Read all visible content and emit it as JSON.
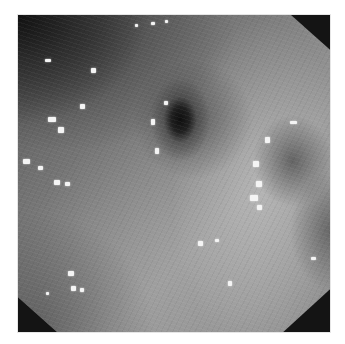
{
  "image": {
    "description": "Grayscale endoscopic view of mucosal tissue with a dark central lumen opening and a second fainter depression on the right, scattered specular light reflections, framed in an octagonal black mask on a white background",
    "colors": {
      "background": "#ffffff",
      "mask": "#141414",
      "tissue_mid": "#8c8c8c",
      "tissue_dark": "#555555",
      "lumen": "#0a0a0a",
      "highlight": "#f4f4f4"
    },
    "features": [
      {
        "name": "central-lumen",
        "x_pct": 52,
        "y_pct": 33
      },
      {
        "name": "right-depression",
        "x_pct": 88,
        "y_pct": 46
      }
    ],
    "highlights": [
      {
        "x": 27,
        "y": 44,
        "w": 6,
        "h": 3
      },
      {
        "x": 73,
        "y": 53,
        "w": 5,
        "h": 5
      },
      {
        "x": 30,
        "y": 102,
        "w": 8,
        "h": 5
      },
      {
        "x": 40,
        "y": 112,
        "w": 6,
        "h": 6
      },
      {
        "x": 62,
        "y": 89,
        "w": 5,
        "h": 5
      },
      {
        "x": 5,
        "y": 144,
        "w": 7,
        "h": 5
      },
      {
        "x": 20,
        "y": 151,
        "w": 5,
        "h": 4
      },
      {
        "x": 36,
        "y": 165,
        "w": 6,
        "h": 5
      },
      {
        "x": 47,
        "y": 167,
        "w": 5,
        "h": 4
      },
      {
        "x": 146,
        "y": 86,
        "w": 4,
        "h": 4
      },
      {
        "x": 133,
        "y": 104,
        "w": 4,
        "h": 6
      },
      {
        "x": 137,
        "y": 133,
        "w": 4,
        "h": 6
      },
      {
        "x": 272,
        "y": 106,
        "w": 7,
        "h": 3
      },
      {
        "x": 247,
        "y": 122,
        "w": 5,
        "h": 6
      },
      {
        "x": 235,
        "y": 146,
        "w": 6,
        "h": 6
      },
      {
        "x": 238,
        "y": 166,
        "w": 6,
        "h": 6
      },
      {
        "x": 232,
        "y": 180,
        "w": 8,
        "h": 6
      },
      {
        "x": 239,
        "y": 190,
        "w": 5,
        "h": 5
      },
      {
        "x": 180,
        "y": 226,
        "w": 5,
        "h": 5
      },
      {
        "x": 197,
        "y": 224,
        "w": 4,
        "h": 3
      },
      {
        "x": 293,
        "y": 242,
        "w": 5,
        "h": 3
      },
      {
        "x": 50,
        "y": 256,
        "w": 6,
        "h": 5
      },
      {
        "x": 53,
        "y": 271,
        "w": 5,
        "h": 5
      },
      {
        "x": 62,
        "y": 273,
        "w": 4,
        "h": 4
      },
      {
        "x": 28,
        "y": 277,
        "w": 3,
        "h": 3
      },
      {
        "x": 210,
        "y": 266,
        "w": 4,
        "h": 5
      },
      {
        "x": 133,
        "y": 7,
        "w": 4,
        "h": 3
      },
      {
        "x": 147,
        "y": 5,
        "w": 3,
        "h": 3
      },
      {
        "x": 117,
        "y": 9,
        "w": 3,
        "h": 3
      }
    ]
  }
}
